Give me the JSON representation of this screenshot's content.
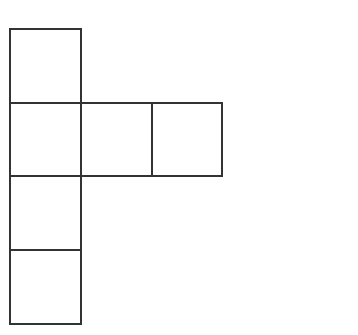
{
  "diagram": {
    "type": "cube-net",
    "stroke_color": "#333333",
    "stroke_width": 2,
    "fill_color": "#ffffff",
    "squares": [
      {
        "id": "top",
        "x": 10,
        "y": 29,
        "w": 71,
        "h": 74
      },
      {
        "id": "row2-col1",
        "x": 10,
        "y": 103,
        "w": 71,
        "h": 73
      },
      {
        "id": "row2-col2",
        "x": 81,
        "y": 103,
        "w": 71,
        "h": 73
      },
      {
        "id": "row2-col3",
        "x": 152,
        "y": 103,
        "w": 70,
        "h": 73
      },
      {
        "id": "row3",
        "x": 10,
        "y": 176,
        "w": 71,
        "h": 74
      },
      {
        "id": "row4",
        "x": 10,
        "y": 250,
        "w": 71,
        "h": 74
      }
    ]
  }
}
